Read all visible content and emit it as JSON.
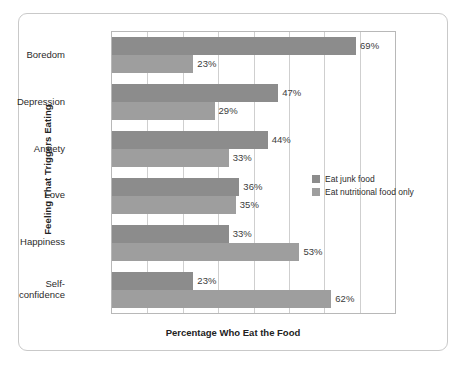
{
  "chart_data": {
    "type": "bar",
    "orientation": "horizontal",
    "title": "",
    "xlabel": "Percentage Who Eat the Food",
    "ylabel": "Feeling That Triggers Eating",
    "categories": [
      "Boredom",
      "Depression",
      "Anxiety",
      "Love",
      "Happiness",
      "Self-\nconfidence"
    ],
    "series": [
      {
        "name": "Eat junk food",
        "color": "#8c8c8c",
        "values": [
          69,
          47,
          44,
          36,
          33,
          23
        ],
        "labels": [
          "69%",
          "47%",
          "44%",
          "36%",
          "33%",
          "23%"
        ]
      },
      {
        "name": "Eat nutritional food only",
        "color": "#9e9e9e",
        "values": [
          23,
          29,
          33,
          35,
          53,
          62
        ],
        "labels": [
          "23%",
          "29%",
          "33%",
          "35%",
          "53%",
          "62%"
        ]
      }
    ],
    "xlim": [
      0,
      80
    ],
    "xtick_step": 10,
    "xticklabels": [],
    "grid": "vertical",
    "legend_position": "right-middle"
  },
  "legend": {
    "items": [
      {
        "label": "Eat junk food",
        "color": "#8c8c8c"
      },
      {
        "label": "Eat nutritional food only",
        "color": "#9e9e9e"
      }
    ]
  },
  "axis": {
    "x_title": "Percentage Who Eat the Food",
    "y_title": "Feeling That Triggers Eating"
  },
  "categories": [
    {
      "line1": "Boredom",
      "line2": ""
    },
    {
      "line1": "Depression",
      "line2": ""
    },
    {
      "line1": "Anxiety",
      "line2": ""
    },
    {
      "line1": "Love",
      "line2": ""
    },
    {
      "line1": "Happiness",
      "line2": ""
    },
    {
      "line1": "Self-",
      "line2": "confidence"
    }
  ]
}
